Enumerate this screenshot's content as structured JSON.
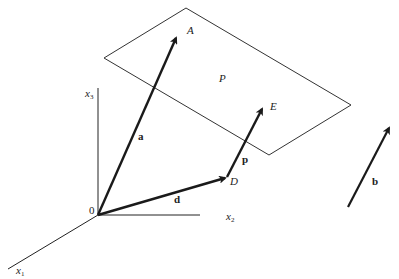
{
  "figure": {
    "colors": {
      "background": "#ffffff",
      "ink": "#1a1a1a",
      "plane": "#333333"
    }
  },
  "axes": {
    "origin": {
      "label": "0",
      "x": 98,
      "y": 215
    },
    "x1": {
      "label": "x",
      "sub": "1",
      "end": [
        8,
        269
      ]
    },
    "x2": {
      "label": "x",
      "sub": "2",
      "end": [
        200,
        215
      ]
    },
    "x3": {
      "label": "x",
      "sub": "3",
      "end": [
        98,
        88
      ]
    }
  },
  "plane": {
    "label": "P",
    "corners": [
      [
        104,
        58
      ],
      [
        186,
        8
      ],
      [
        351,
        105
      ],
      [
        269,
        155
      ]
    ]
  },
  "points": {
    "A": {
      "label": "A",
      "x": 177,
      "y": 35
    },
    "D": {
      "label": "D",
      "x": 227,
      "y": 177
    },
    "E": {
      "label": "E",
      "x": 263,
      "y": 106
    }
  },
  "vectors": {
    "a": {
      "label": "a",
      "from": "0",
      "to": "A"
    },
    "d": {
      "label": "d",
      "from": "0",
      "to": "D"
    },
    "p": {
      "label": "p",
      "from": "D",
      "to": "E"
    },
    "b": {
      "label": "b",
      "from": [
        348,
        207
      ],
      "to": [
        390,
        125
      ]
    }
  }
}
